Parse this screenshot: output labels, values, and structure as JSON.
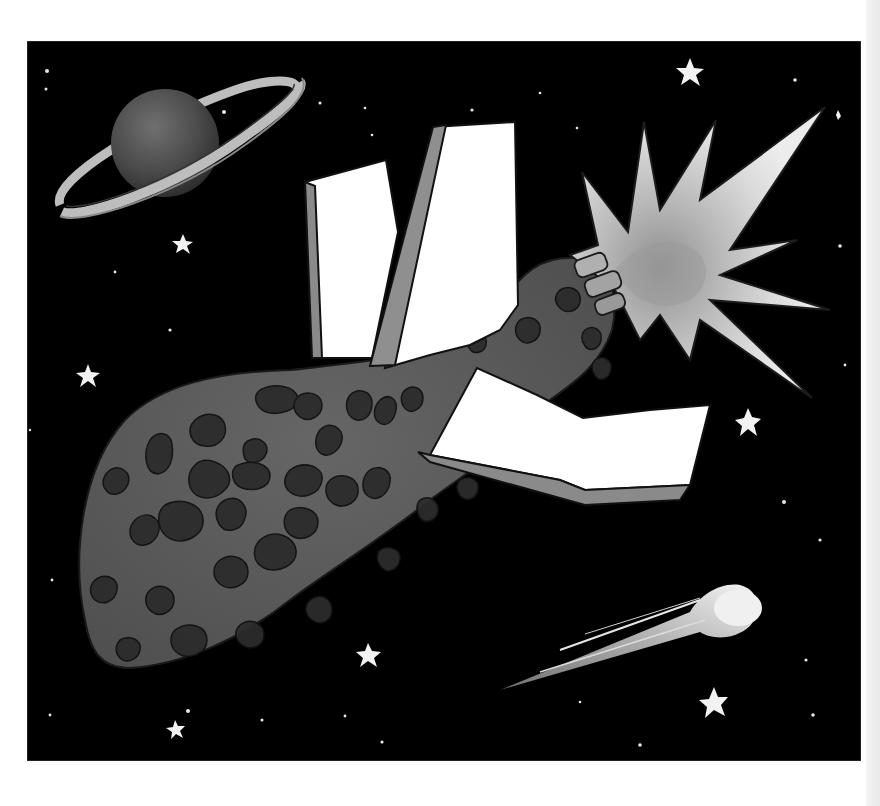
{
  "illustration": {
    "subject": "Space scene: asteroid with a white-winged spacecraft, exploding star-burst engine flare, ringed planet, comet and stars",
    "style": "grayscale hand-drawn watercolor illustration",
    "panel": {
      "x": 27,
      "y": 41,
      "width": 834,
      "height": 720,
      "background": "#000000",
      "border": "#555555"
    },
    "colors": {
      "space": "#000000",
      "star": "#f2f2f2",
      "planet": "#4a4a4a",
      "planet_highlight": "#6a6a6a",
      "ring": "#bdbdbd",
      "asteroid": "#5e5e5e",
      "crater": "#2c2c2c",
      "crater_rim": "#7a7a7a",
      "wing": "#ffffff",
      "wing_edge": "#8a8a8a",
      "burst_outer": "#e3e3e3",
      "burst_inner": "#a8a8a8",
      "comet": "#eeeeee"
    },
    "elements": [
      {
        "name": "ringed-planet",
        "cx": 165,
        "cy": 143,
        "r": 55
      },
      {
        "name": "asteroid",
        "approx_bbox": [
          80,
          255,
          620,
          680
        ]
      },
      {
        "name": "spacecraft-wings",
        "count": 3
      },
      {
        "name": "explosion-burst",
        "cx": 690,
        "cy": 270
      },
      {
        "name": "comet",
        "head": [
          735,
          600
        ],
        "tail_end": [
          500,
          690
        ]
      },
      {
        "name": "large-stars",
        "positions": [
          [
            690,
            70
          ],
          [
            183,
            243
          ],
          [
            88,
            375
          ],
          [
            750,
            423
          ],
          [
            368,
            655
          ],
          [
            712,
            705
          ],
          [
            175,
            730
          ]
        ]
      }
    ]
  }
}
